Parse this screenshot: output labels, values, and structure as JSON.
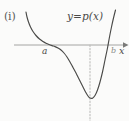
{
  "figure": {
    "part_label": "(i)",
    "curve_label": "y=p(x)",
    "x_axis_label": "x",
    "root_left_label": "a",
    "root_right_label": "b",
    "background_color": "#fbfbfa",
    "curve_color": "#4a4a48",
    "axis_color": "#9a9a98",
    "dotted_line_color": "#bdbdbb"
  },
  "chart_data": {
    "type": "line",
    "title": "(i)",
    "xlabel": "x",
    "ylabel": "",
    "annotations": [
      {
        "text": "y=p(x)",
        "x": 67,
        "y": 11,
        "role": "curve-label"
      },
      {
        "text": "a",
        "x": 44,
        "y": 50,
        "role": "x-intercept-label"
      },
      {
        "text": "b",
        "x": 112,
        "y": 50,
        "role": "x-intercept-label"
      },
      {
        "text": "x",
        "x": 121,
        "y": 50,
        "role": "axis-label"
      }
    ],
    "axis": {
      "x_axis_y_px": 45,
      "x_axis_start_px": 14,
      "x_axis_end_px": 127,
      "arrow": "right"
    },
    "x_intercepts_px": [
      46,
      112
    ],
    "minimum_px": {
      "x": 90,
      "y": 98
    },
    "dotted_vertical_line": {
      "x_px": 90,
      "y_start_px": 45,
      "y_end_px": 121
    },
    "grid": false,
    "legend": "none",
    "curve_points_px": [
      [
        26,
        12
      ],
      [
        27,
        17
      ],
      [
        28.5,
        22
      ],
      [
        30.5,
        27
      ],
      [
        33,
        31.5
      ],
      [
        36,
        35.5
      ],
      [
        39.5,
        39
      ],
      [
        43,
        41.5
      ],
      [
        46,
        43.2
      ],
      [
        49,
        44.5
      ],
      [
        52,
        45.6
      ],
      [
        55,
        46.6
      ],
      [
        58,
        48
      ],
      [
        61,
        50
      ],
      [
        64,
        53
      ],
      [
        67,
        57
      ],
      [
        70,
        62
      ],
      [
        73,
        67.5
      ],
      [
        76,
        73
      ],
      [
        79,
        79
      ],
      [
        82,
        85
      ],
      [
        85,
        91
      ],
      [
        88,
        96
      ],
      [
        90,
        98
      ],
      [
        92.5,
        98.2
      ],
      [
        95,
        95.5
      ],
      [
        97.5,
        90
      ],
      [
        100,
        82
      ],
      [
        102.5,
        72
      ],
      [
        105,
        60
      ],
      [
        107.5,
        48
      ],
      [
        109.5,
        37
      ],
      [
        111.5,
        27
      ],
      [
        113.5,
        18
      ],
      [
        115.5,
        10
      ]
    ]
  }
}
